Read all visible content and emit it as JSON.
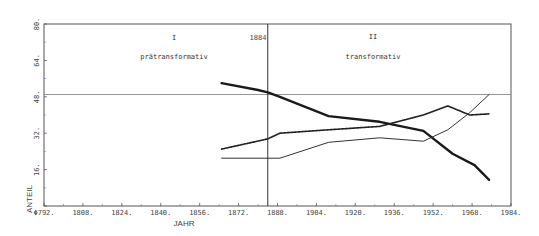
{
  "chart_data": {
    "type": "line",
    "title": "",
    "xlabel": "JAHR",
    "ylabel": "ANTEIL",
    "xlim": [
      1792,
      1984
    ],
    "ylim": [
      0,
      80
    ],
    "x_ticks": [
      "1792.",
      "1808.",
      "1824.",
      "1840.",
      "1856.",
      "1872.",
      "1888.",
      "1904.",
      "1920.",
      "1936.",
      "1952.",
      "1968.",
      "1984."
    ],
    "y_ticks": [
      "16.",
      "32.",
      "48.",
      "64.",
      "80."
    ],
    "grid": false,
    "reference_lines": {
      "horizontal": {
        "y": 49
      },
      "vertical": {
        "x": 1884,
        "label": "1884"
      }
    },
    "regions": [
      {
        "numeral": "I",
        "label": "prätransformativ"
      },
      {
        "numeral": "II",
        "label": "transformativ"
      }
    ],
    "series": [
      {
        "name": "series-1 (thick solid, declining)",
        "style": "thick",
        "x": [
          1865,
          1880,
          1884,
          1889,
          1909,
          1930,
          1948,
          1960,
          1969,
          1975
        ],
        "values": [
          54,
          51,
          50,
          48,
          39.5,
          37,
          33,
          23,
          18,
          11.5
        ]
      },
      {
        "name": "series-2 (dotted, rising)",
        "style": "dotted",
        "x": [
          1865,
          1884,
          1889,
          1909,
          1930,
          1948,
          1958,
          1967,
          1975
        ],
        "values": [
          25,
          29.5,
          32,
          33.5,
          35,
          40,
          44,
          40,
          40.5
        ]
      },
      {
        "name": "series-3 (thin, low then high)",
        "style": "thin",
        "x": [
          1865,
          1880,
          1889,
          1909,
          1930,
          1948,
          1958,
          1967,
          1975
        ],
        "values": [
          21,
          21,
          21,
          28,
          30,
          28.5,
          33.5,
          41,
          49
        ]
      }
    ]
  },
  "labels": {
    "xlabel": "JAHR",
    "ylabel": "ANTEIL",
    "vline_label": "1884",
    "region1_numeral": "I",
    "region1_label": "prätransformativ",
    "region2_numeral": "II",
    "region2_label": "transformativ"
  }
}
